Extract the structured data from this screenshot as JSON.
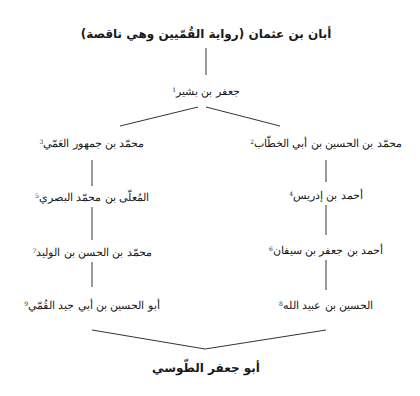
{
  "diagram": {
    "root": {
      "label": "أبان بن عثمان (رواية القُمّيين وهي ناقصة)"
    },
    "second": {
      "label": "جعفر بن بشير",
      "note": "1"
    },
    "right_branch": [
      {
        "label": "محمّد بن الحسين بن أبي الخطّاب",
        "note": "2"
      },
      {
        "label": "أحمد بن إدريس",
        "note": "4"
      },
      {
        "label": "أحمد بن جعفر بن سيفان",
        "note": "6"
      },
      {
        "label": "الحسين بن عبيد الله",
        "note": "8"
      }
    ],
    "left_branch": [
      {
        "label": "محمّد بن جمهور العَمّي",
        "note": "3"
      },
      {
        "label": "المُعلّى بن محمّد البصري",
        "note": "5"
      },
      {
        "label": "محمّد بن الحسن بن الوليد",
        "note": "7"
      },
      {
        "label": "أبو الحسين بن أبي جيد القُمّي",
        "note": "9"
      }
    ],
    "terminal": {
      "label": "أبو جعفر الطّوسي"
    }
  }
}
